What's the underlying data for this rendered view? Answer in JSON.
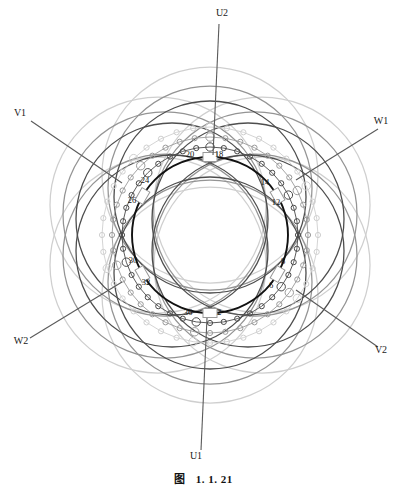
{
  "figure": {
    "caption_symbol": "图",
    "caption_number": "1. 1. 21"
  },
  "terminals": [
    {
      "id": "U2",
      "label": "U2",
      "x": 222,
      "y": 16,
      "lead_x1": 219,
      "lead_y1": 24,
      "lead_x2": 213,
      "lead_y2": 155
    },
    {
      "id": "W1",
      "label": "W1",
      "x": 381,
      "y": 124,
      "lead_x1": 378,
      "lead_y1": 129,
      "lead_x2": 296,
      "lead_y2": 180
    },
    {
      "id": "V2",
      "label": "V2",
      "x": 381,
      "y": 353,
      "lead_x1": 378,
      "lead_y1": 347,
      "lead_x2": 296,
      "lead_y2": 290
    },
    {
      "id": "U1",
      "label": "U1",
      "x": 196,
      "y": 459,
      "lead_x1": 201,
      "lead_y1": 450,
      "lead_x2": 207,
      "lead_y2": 318
    },
    {
      "id": "W2",
      "label": "W2",
      "x": 21,
      "y": 344,
      "lead_x1": 30,
      "lede_y1": 338,
      "lead_y1": 338,
      "lead_x2": 122,
      "lead_y2": 282
    },
    {
      "id": "V1",
      "label": "V1",
      "x": 20,
      "y": 116,
      "lead_x1": 31,
      "lead_y1": 121,
      "lead_x2": 122,
      "lead_y2": 183
    }
  ],
  "slot_labels": [
    {
      "id": "20",
      "label": "20",
      "x": 190,
      "y": 157
    },
    {
      "id": "18",
      "label": "18",
      "x": 219,
      "y": 157
    },
    {
      "id": "14",
      "label": "14",
      "x": 265,
      "y": 185
    },
    {
      "id": "12",
      "label": "12",
      "x": 276,
      "y": 205
    },
    {
      "id": "8",
      "label": "8",
      "x": 283,
      "y": 264
    },
    {
      "id": "6",
      "label": "6",
      "x": 271,
      "y": 288
    },
    {
      "id": "36",
      "label": "36",
      "x": 188,
      "y": 315
    },
    {
      "id": "2",
      "label": "2",
      "x": 219,
      "y": 315
    },
    {
      "id": "30",
      "label": "30",
      "x": 133,
      "y": 263
    },
    {
      "id": "32",
      "label": "32",
      "x": 146,
      "y": 285
    },
    {
      "id": "24",
      "label": "24",
      "x": 145,
      "y": 183
    },
    {
      "id": "26",
      "label": "26",
      "x": 132,
      "y": 203
    }
  ],
  "geometry": {
    "center_x": 210,
    "center_y": 235,
    "bore_radius": 78,
    "coil_chain_radii": [
      88,
      98,
      108
    ],
    "end_loop_radius": 108,
    "end_loop_offset": 58,
    "slot_marker_count": 6,
    "slot_angles_deg": [
      270,
      330,
      30,
      90,
      150,
      210
    ]
  },
  "colors": {
    "bore_stroke": "#111111",
    "phase_u": "#3a3a3a",
    "phase_v": "#8f8f8f",
    "phase_w": "#c9c9c9",
    "chain_dark": "#4a4a4a",
    "chain_mid": "#9a9a9a",
    "chain_light": "#cfcfcf",
    "lead_line": "#555555",
    "background": "#ffffff"
  },
  "phases": [
    {
      "name": "U",
      "start_terminal": "U1",
      "end_terminal": "U2",
      "color_key": "phase_u"
    },
    {
      "name": "V",
      "start_terminal": "V1",
      "end_terminal": "V2",
      "color_key": "phase_v"
    },
    {
      "name": "W",
      "start_terminal": "W1",
      "end_terminal": "W2",
      "color_key": "phase_w"
    }
  ]
}
